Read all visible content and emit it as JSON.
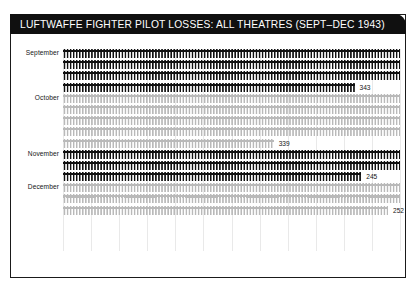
{
  "header": {
    "title": "LUFTWAFFE FIGHTER PILOT LOSSES: ALL THEATRES (SEPT–DEC 1943)",
    "background_color": "#101010",
    "text_color": "#ffffff"
  },
  "chart_data": {
    "type": "bar",
    "subtype": "pictogram-isotype",
    "title": "LUFTWAFFE FIGHTER PILOT LOSSES: ALL THEATRES (SEPT–DEC 1943)",
    "xlabel": "",
    "ylabel": "",
    "categories": [
      "September",
      "October",
      "November",
      "December"
    ],
    "values": [
      343,
      339,
      245,
      252
    ],
    "value_labels": [
      "343",
      "339",
      "245",
      "252"
    ],
    "units": "pilots lost",
    "grid": true,
    "gridline_count": 12,
    "legend": null,
    "series": [
      {
        "name": "Pilot losses",
        "values": [
          343,
          339,
          245,
          252
        ]
      }
    ],
    "glyph": {
      "icon": "aircraft-silhouette",
      "per_row_capacity": 96,
      "note": "each glyph represents one pilot lost; rows wrap"
    },
    "colors": {
      "dark": "#101010",
      "light": "#b9b9b9",
      "background": "#ffffff",
      "gridline": "#e9e9e9",
      "border": "#1a1a1a"
    },
    "months": [
      {
        "label": "September",
        "value": 343,
        "value_label": "343",
        "tone": "dark",
        "rows": [
          100,
          100,
          100,
          86.5
        ]
      },
      {
        "label": "October",
        "value": 339,
        "value_label": "339",
        "tone": "light",
        "rows": [
          100,
          100,
          100,
          100,
          62.5
        ]
      },
      {
        "label": "November",
        "value": 245,
        "value_label": "245",
        "tone": "dark",
        "rows": [
          100,
          100,
          88.5
        ]
      },
      {
        "label": "December",
        "value": 252,
        "value_label": "252",
        "tone": "light",
        "rows": [
          100,
          100,
          96.5
        ]
      }
    ]
  }
}
